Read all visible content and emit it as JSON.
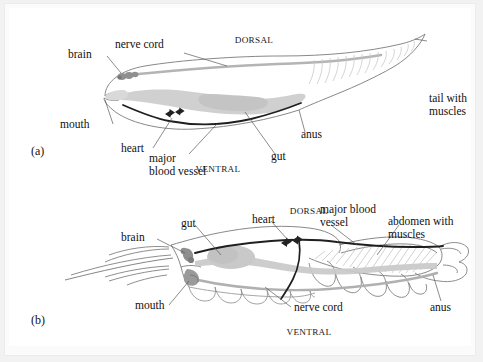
{
  "figure": {
    "background_color": "#ffffff",
    "panels": [
      {
        "id": "a",
        "panel_label": "(a)",
        "orientation_top": "DORSAL",
        "orientation_bottom": "VENTRAL",
        "subject": "chordate larva body plan",
        "labels": [
          {
            "key": "brain",
            "text": "brain"
          },
          {
            "key": "nerve_cord",
            "text": "nerve cord"
          },
          {
            "key": "mouth",
            "text": "mouth"
          },
          {
            "key": "heart",
            "text": "heart"
          },
          {
            "key": "major_blood_vessel",
            "text": "major\nblood vessel",
            "line1": "major",
            "line2": "blood vessel"
          },
          {
            "key": "gut",
            "text": "gut"
          },
          {
            "key": "anus",
            "text": "anus"
          },
          {
            "key": "tail_with_muscles",
            "text": "tail with\nmuscles",
            "line1": "tail with",
            "line2": "muscles"
          }
        ]
      },
      {
        "id": "b",
        "panel_label": "(b)",
        "orientation_top": "DORSAL",
        "orientation_bottom": "VENTRAL",
        "subject": "arthropod (crustacean) body plan",
        "labels": [
          {
            "key": "brain",
            "text": "brain"
          },
          {
            "key": "gut",
            "text": "gut"
          },
          {
            "key": "heart",
            "text": "heart"
          },
          {
            "key": "major_blood_vessel",
            "text": "major blood\nvessel",
            "line1": "major blood",
            "line2": "vessel"
          },
          {
            "key": "abdomen_with_muscles",
            "text": "abdomen with\nmuscles",
            "line1": "abdomen with",
            "line2": "muscles"
          },
          {
            "key": "mouth",
            "text": "mouth"
          },
          {
            "key": "nerve_cord",
            "text": "nerve cord"
          },
          {
            "key": "anus",
            "text": "anus"
          }
        ]
      }
    ],
    "colors": {
      "outline": "#7a7a7a",
      "gut_fill": "#c9c9c9",
      "nerve_cord": "#b0b0b0",
      "blood_vessel": "#1f1f1f",
      "heart": "#2b2b2b",
      "brain": "#8c8c8c",
      "muscle_stripe": "#c2c2c2",
      "leader_line": "#5a5a5a",
      "text": "#111111",
      "page_background": "#f2f2f2",
      "panel_background": "#ffffff"
    }
  }
}
